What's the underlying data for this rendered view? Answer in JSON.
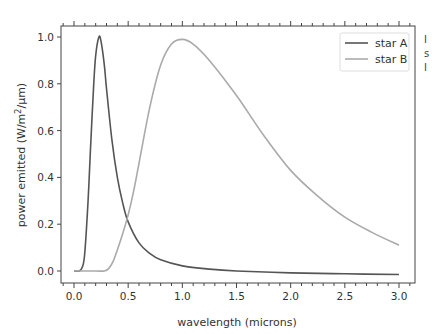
{
  "chart_data": {
    "type": "line",
    "title": "",
    "xlabel": "wavelength (microns)",
    "ylabel": "power emitted (W/m²/µm)",
    "xlim": [
      -0.13,
      3.13
    ],
    "ylim": [
      -0.05,
      1.05
    ],
    "xticks": [
      "0.0",
      "0.5",
      "1.0",
      "1.5",
      "2.0",
      "2.5",
      "3.0"
    ],
    "yticks": [
      "0.0",
      "0.2",
      "0.4",
      "0.6",
      "0.8",
      "1.0"
    ],
    "grid": false,
    "legend_position": "upper right",
    "series": [
      {
        "name": "star A",
        "color": "#555555",
        "x": [
          0.0,
          0.05,
          0.08,
          0.1,
          0.13,
          0.15,
          0.18,
          0.2,
          0.23,
          0.25,
          0.28,
          0.3,
          0.35,
          0.4,
          0.45,
          0.5,
          0.6,
          0.7,
          0.8,
          1.0,
          1.25,
          1.5,
          2.0,
          2.5,
          3.0
        ],
        "y": [
          0.0,
          0.0,
          0.02,
          0.08,
          0.3,
          0.5,
          0.78,
          0.92,
          1.0,
          0.98,
          0.88,
          0.78,
          0.56,
          0.4,
          0.29,
          0.21,
          0.12,
          0.075,
          0.048,
          0.022,
          0.008,
          0.0,
          -0.008,
          -0.012,
          -0.015
        ]
      },
      {
        "name": "star B",
        "color": "#aaaaaa",
        "x": [
          0.0,
          0.2,
          0.28,
          0.32,
          0.36,
          0.4,
          0.45,
          0.5,
          0.55,
          0.6,
          0.7,
          0.8,
          0.9,
          1.0,
          1.1,
          1.25,
          1.5,
          1.75,
          2.0,
          2.25,
          2.5,
          2.75,
          3.0
        ],
        "y": [
          0.0,
          0.0,
          0.0,
          0.01,
          0.04,
          0.09,
          0.16,
          0.24,
          0.34,
          0.46,
          0.7,
          0.88,
          0.97,
          0.99,
          0.97,
          0.9,
          0.75,
          0.58,
          0.43,
          0.32,
          0.23,
          0.165,
          0.11
        ]
      }
    ]
  },
  "legend": {
    "items": [
      "star A",
      "star B"
    ]
  },
  "cut_text": [
    "I",
    "s",
    "I"
  ]
}
